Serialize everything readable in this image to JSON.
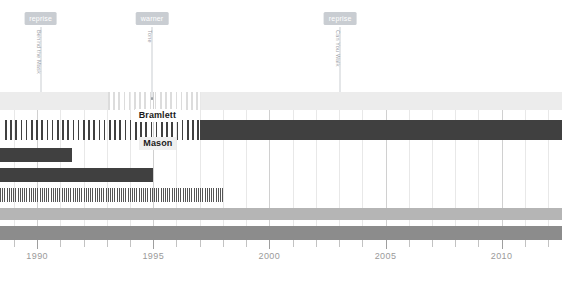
{
  "chart_data": {
    "type": "bar",
    "title": "",
    "xlabel": "",
    "ylabel": "",
    "xlim": [
      1988.4,
      2012.6
    ],
    "grid": true,
    "legend": null,
    "tick_labels": [
      "1990",
      "1995",
      "2000",
      "2005",
      "2010"
    ],
    "tick_values": [
      1990,
      1995,
      2000,
      2005,
      2010
    ],
    "minor_tick_step": 1,
    "colors": {
      "dark_bar": "#404040",
      "mid_gray_bar": "#8c8c8c",
      "light_gray_bar": "#b5b5b5",
      "very_light_bar": "#ececec",
      "annotation_tag": "#c9cdd2",
      "annotation_text": "#9aa0a6",
      "axis_text": "#9a9a9a",
      "gridline": "#e8e8e8",
      "gridline_major": "#d0d0d0"
    },
    "annotations": [
      {
        "label": "reprise",
        "song": "Behind the Mask",
        "year": 1990.15
      },
      {
        "label": "warner",
        "song": "Tone",
        "year": 1994.95
      },
      {
        "label": "reprise",
        "song": "Can You Walk",
        "year": 2003.05
      }
    ],
    "rows": [
      {
        "name": "row-1",
        "segments": [
          {
            "start": 1988.4,
            "end": 1993.05,
            "style": "solid",
            "color": "#ececec"
          },
          {
            "start": 1993.05,
            "end": 1997.05,
            "style": "dashed",
            "color": "#dcdcdc"
          },
          {
            "start": 1997.05,
            "end": 2012.6,
            "style": "solid",
            "color": "#ececec"
          }
        ],
        "label": null
      },
      {
        "name": "row-2",
        "segments": [
          {
            "start": 1988.6,
            "end": 1997.0,
            "style": "dashed",
            "color": "#404040"
          },
          {
            "start": 1997.0,
            "end": 2012.6,
            "style": "solid",
            "color": "#404040"
          }
        ],
        "label": {
          "text": "Bramlett",
          "year": 1994.2,
          "tone": "on-light"
        }
      },
      {
        "name": "row-3",
        "segments": [
          {
            "start": 1988.4,
            "end": 1991.5,
            "style": "solid",
            "color": "#404040"
          }
        ],
        "label": {
          "text": "Mason",
          "year": 1994.4,
          "tone": "on-dark"
        }
      },
      {
        "name": "row-4",
        "segments": [
          {
            "start": 1988.4,
            "end": 1995.0,
            "style": "solid",
            "color": "#404040"
          }
        ],
        "label": null
      },
      {
        "name": "row-5",
        "segments": [
          {
            "start": 1988.4,
            "end": 1998.0,
            "style": "fine",
            "color": "#555555"
          }
        ],
        "label": null
      },
      {
        "name": "row-6",
        "segments": [
          {
            "start": 1988.4,
            "end": 2012.6,
            "style": "solid",
            "color": "#b5b5b5"
          }
        ],
        "label": null
      },
      {
        "name": "row-7",
        "segments": [
          {
            "start": 1988.4,
            "end": 2012.6,
            "style": "solid",
            "color": "#8c8c8c"
          }
        ],
        "label": null
      }
    ]
  }
}
